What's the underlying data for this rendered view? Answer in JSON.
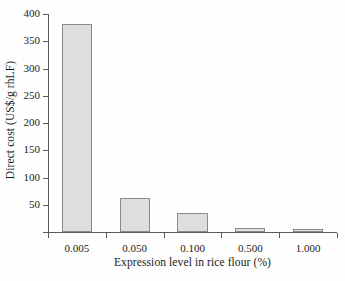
{
  "chart_data": {
    "type": "bar",
    "title": "",
    "xlabel": "Expression level in rice flour (%)",
    "ylabel": "Direct cost (US$/g rhLF)",
    "categories": [
      "0.005",
      "0.050",
      "0.100",
      "0.500",
      "1.000"
    ],
    "values": [
      382,
      62,
      35,
      7,
      6
    ],
    "ylim": [
      0,
      400
    ],
    "yticks": [
      0,
      50,
      100,
      150,
      200,
      250,
      300,
      350,
      400
    ],
    "ytick_labels": [
      "",
      "50",
      "100",
      "150",
      "200",
      "250",
      "300",
      "350",
      "400"
    ],
    "grid": false,
    "legend": null,
    "bar_fill_color": "#dedede",
    "bar_edge_color": "#8a8a8a",
    "axis_color": "#5a5a5a",
    "background_color": "#ffffff"
  }
}
